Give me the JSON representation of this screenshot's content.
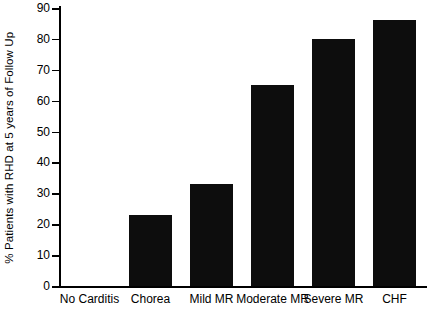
{
  "chart_data": {
    "type": "bar",
    "title": "",
    "xlabel": "",
    "ylabel": "% Patients with RHD at 5 years of Follow Up",
    "categories": [
      "No Carditis",
      "Chorea",
      "Mild MR",
      "Moderate MR",
      "Severe MR",
      "CHF"
    ],
    "values": [
      0,
      23,
      33,
      65,
      80,
      86
    ],
    "ylim": [
      0,
      90
    ],
    "yticks": [
      0,
      10,
      20,
      30,
      40,
      50,
      60,
      70,
      80,
      90
    ],
    "ytick_labels": [
      "0",
      "10",
      "20",
      "30",
      "40",
      "50",
      "60",
      "70",
      "80",
      "90"
    ],
    "grid": false,
    "legend": false,
    "bar_color": "#0d0d0d",
    "axis_color": "#000000",
    "background": "#ffffff"
  }
}
